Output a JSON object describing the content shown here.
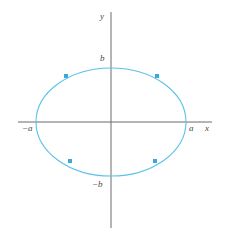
{
  "figure": {
    "title": "",
    "background_color": "#ffffff"
  },
  "axes": {
    "x_axis_label": "x",
    "y_axis_label": "y",
    "axis_color": "#6b6b6b",
    "origin_x": 111,
    "origin_y": 122,
    "x_axis_start": 18,
    "x_axis_end": 212,
    "y_axis_start": 12,
    "y_axis_end": 228
  },
  "tick_labels": {
    "x_positive": "a",
    "x_negative": "−a",
    "y_positive": "b",
    "y_negative": "−b"
  },
  "chart_data": {
    "type": "line",
    "title": "",
    "xlabel": "x",
    "ylabel": "y",
    "grid": false,
    "legend": "none",
    "curve_color": "#5bc2e7",
    "marker_color": "#3aa8d8",
    "curve": {
      "name": "ellipse",
      "equation": "x^2/a^2 + y^2/b^2 = 1",
      "center": [
        0,
        0
      ],
      "semi_axis_x": "a",
      "semi_axis_y": "b",
      "semi_axis_x_px": 75,
      "semi_axis_y_px": 54
    },
    "xlim": [
      "-a",
      "a"
    ],
    "ylim": [
      "-b",
      "b"
    ],
    "xtick_values": [
      "-a",
      "a"
    ],
    "ytick_values": [
      "-b",
      "b"
    ],
    "markers": [
      {
        "name": "upper-left-point",
        "angle_deg": 145,
        "x_px": 66,
        "y_px": 76
      },
      {
        "name": "upper-right-point",
        "angle_deg": 35,
        "x_px": 157,
        "y_px": 76
      },
      {
        "name": "lower-left-point",
        "angle_deg": 215,
        "x_px": 70,
        "y_px": 161
      },
      {
        "name": "lower-right-point",
        "angle_deg": 325,
        "x_px": 155,
        "y_px": 161
      }
    ]
  }
}
